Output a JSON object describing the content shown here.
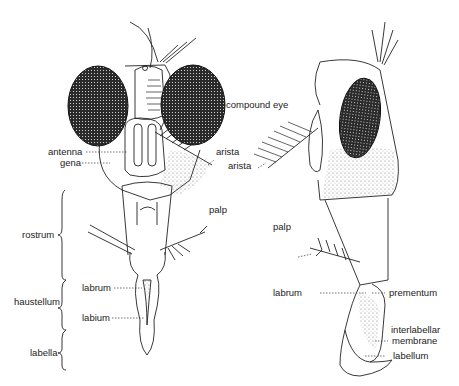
{
  "figure": {
    "front_view": {
      "labels": {
        "antenna": "antenna",
        "gena": "gena",
        "arista": "arista",
        "compound_eye": "compound eye",
        "palp": "palp",
        "labrum": "labrum",
        "labium": "labium"
      },
      "regions": {
        "rostrum": "rostrum",
        "haustellum": "haustellum",
        "labella": "labella"
      }
    },
    "side_view": {
      "labels": {
        "arista": "arista",
        "palp": "palp",
        "labrum": "labrum",
        "prementum": "prementum",
        "interlabellar_1": "interlabellar",
        "interlabellar_2": "membrane",
        "labellum": "labellum"
      }
    }
  }
}
